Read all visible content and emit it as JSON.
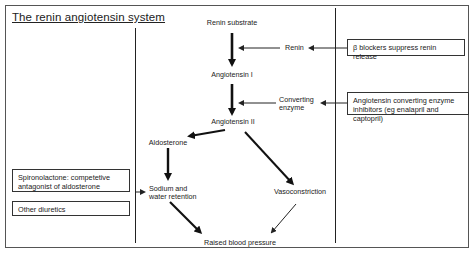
{
  "title": "The renin angiotensin system",
  "nodes": {
    "renin_substrate": "Renin substrate",
    "angiotensin_1": "Angiotensin I",
    "angiotensin_2": "Angiotensin II",
    "aldosterone": "Aldosterone",
    "sodium_line1": "Sodium and",
    "sodium_line2": "water retention",
    "vasoconstriction": "Vasoconstriction",
    "raised_bp": "Raised blood pressure",
    "renin": "Renin",
    "converting_line1": "Converting",
    "converting_line2": "enzyme"
  },
  "boxes": {
    "beta_blockers": "β blockers suppress renin release",
    "ace_line1": "Angiotensin converting enzyme",
    "ace_line2": "inhibitors (eg enalapril and captopril)",
    "spiro_line1": "Spironolactone: competetive",
    "spiro_line2": "antagonist of aldosterone",
    "diuretics": "Other diuretics"
  },
  "colors": {
    "line": "#222222",
    "frame": "#555555",
    "background": "#ffffff"
  }
}
